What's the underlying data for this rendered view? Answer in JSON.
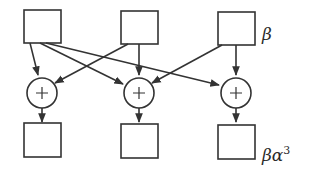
{
  "diagram": {
    "type": "flow-network",
    "colors": {
      "stroke": "#333333",
      "background": "#ffffff"
    },
    "top_row": {
      "nodes": [
        {
          "id": "in1",
          "shape": "square"
        },
        {
          "id": "in2",
          "shape": "square"
        },
        {
          "id": "in3",
          "shape": "square"
        }
      ],
      "label": "β"
    },
    "adders": [
      {
        "id": "add1",
        "symbol": "+"
      },
      {
        "id": "add2",
        "symbol": "+"
      },
      {
        "id": "add3",
        "symbol": "+"
      }
    ],
    "bottom_row": {
      "nodes": [
        {
          "id": "out1",
          "shape": "square"
        },
        {
          "id": "out2",
          "shape": "square"
        },
        {
          "id": "out3",
          "shape": "square"
        }
      ],
      "label_base": "βα",
      "label_exp": "3"
    },
    "edges": [
      {
        "from": "in1",
        "to": "add1"
      },
      {
        "from": "in1",
        "to": "add2"
      },
      {
        "from": "in1",
        "to": "add3"
      },
      {
        "from": "in2",
        "to": "add1"
      },
      {
        "from": "in2",
        "to": "add2"
      },
      {
        "from": "in3",
        "to": "add2"
      },
      {
        "from": "in3",
        "to": "add3"
      },
      {
        "from": "add1",
        "to": "out1"
      },
      {
        "from": "add2",
        "to": "out2"
      },
      {
        "from": "add3",
        "to": "out3"
      }
    ]
  }
}
